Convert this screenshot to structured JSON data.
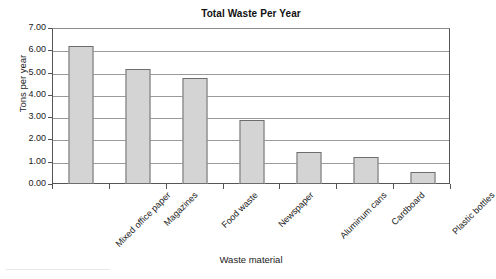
{
  "chart_data": {
    "type": "bar",
    "title": "Total Waste Per Year",
    "xlabel": "Waste material",
    "ylabel": "Tons per year",
    "categories": [
      "Mixed office paper",
      "Magazines",
      "Food waste",
      "Newspaper",
      "Aluminum cans",
      "Cardboard",
      "Plastic bottles"
    ],
    "values": [
      6.25,
      5.2,
      4.8,
      2.9,
      1.45,
      1.2,
      0.55
    ],
    "ylim": [
      0,
      7
    ],
    "ytick_step": 1,
    "ytick_labels": [
      "0.00",
      "1.00",
      "2.00",
      "3.00",
      "4.00",
      "5.00",
      "6.00",
      "7.00"
    ],
    "grid": "horizontal",
    "legend": "none",
    "bar_fill_color": "#d4d4d4",
    "bar_border_color": "#6e6e6e",
    "axis_color": "#555555",
    "gridline_color": "#9a9a9a"
  }
}
